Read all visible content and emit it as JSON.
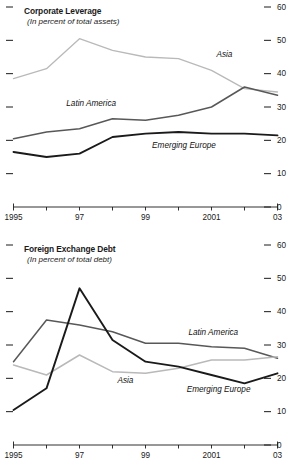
{
  "figure": {
    "background": "#ffffff",
    "colors": {
      "asia": "#b9b9b9",
      "latin_america": "#58585a",
      "emerging_europe": "#1a1a1a",
      "axis": "#1a1a1a",
      "text": "#1a1a1a"
    }
  },
  "chart_data": [
    {
      "type": "line",
      "title": "Corporate Leverage",
      "subtitle": "(In percent of total assets)",
      "xlabel": "",
      "ylabel": "",
      "x": [
        1995,
        1996,
        1997,
        1998,
        1999,
        2000,
        2001,
        2002,
        2003
      ],
      "xtick_labels": [
        "1995",
        "",
        "97",
        "",
        "99",
        "",
        "2001",
        "",
        "03"
      ],
      "ytick_labels": [
        "0",
        "10",
        "20",
        "30",
        "40",
        "50",
        "60"
      ],
      "yticks": [
        0,
        10,
        20,
        30,
        40,
        50,
        60
      ],
      "ylim": [
        0,
        60
      ],
      "grid": false,
      "legend": "inline-annotations",
      "series": [
        {
          "name": "Asia",
          "color": "#b9b9b9",
          "width": 1.3,
          "values": [
            38.5,
            41.5,
            50.5,
            47.0,
            45.0,
            44.5,
            41.0,
            35.5,
            34.5
          ],
          "label_x": 2001.15,
          "label_y": 45.5
        },
        {
          "name": "Latin America",
          "color": "#58585a",
          "width": 1.5,
          "values": [
            20.5,
            22.5,
            23.5,
            26.5,
            26.0,
            27.5,
            30.0,
            36.0,
            33.5
          ],
          "label_x": 1996.6,
          "label_y": 31.0
        },
        {
          "name": "Emerging Europe",
          "color": "#1a1a1a",
          "width": 1.9,
          "values": [
            16.5,
            15.0,
            16.0,
            21.0,
            22.0,
            22.5,
            22.0,
            22.0,
            21.5
          ],
          "label_x": 1999.2,
          "label_y": 18.2
        }
      ]
    },
    {
      "type": "line",
      "title": "Foreign Exchange Debt",
      "subtitle": "(In percent of total debt)",
      "xlabel": "",
      "ylabel": "",
      "x": [
        1995,
        1996,
        1997,
        1998,
        1999,
        2000,
        2001,
        2002,
        2003
      ],
      "xtick_labels": [
        "1995",
        "",
        "97",
        "",
        "99",
        "",
        "2001",
        "",
        "03"
      ],
      "ytick_labels": [
        "0",
        "10",
        "20",
        "30",
        "40",
        "50",
        "60"
      ],
      "yticks": [
        0,
        10,
        20,
        30,
        40,
        50,
        60
      ],
      "ylim": [
        0,
        60
      ],
      "grid": false,
      "legend": "inline-annotations",
      "series": [
        {
          "name": "Latin America",
          "color": "#58585a",
          "width": 1.5,
          "values": [
            25.0,
            37.5,
            36.0,
            34.0,
            30.5,
            30.5,
            29.5,
            29.0,
            26.0
          ],
          "label_x": 2000.3,
          "label_y": 33.5
        },
        {
          "name": "Asia",
          "color": "#b9b9b9",
          "width": 1.5,
          "values": [
            24.0,
            21.0,
            27.0,
            22.0,
            21.5,
            23.0,
            25.5,
            25.5,
            26.5
          ],
          "label_x": 1998.15,
          "label_y": 19.3
        },
        {
          "name": "Emerging Europe",
          "color": "#1a1a1a",
          "width": 1.9,
          "values": [
            10.5,
            17.0,
            47.0,
            31.5,
            25.0,
            23.5,
            21.0,
            18.5,
            21.5
          ],
          "label_x": 2000.25,
          "label_y": 16.5
        }
      ]
    }
  ]
}
